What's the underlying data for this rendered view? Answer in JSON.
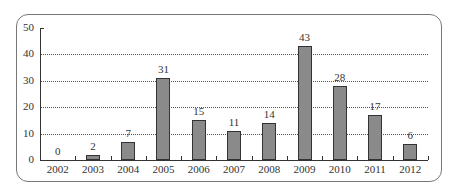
{
  "chart_data": {
    "type": "bar",
    "title": "",
    "xlabel": "",
    "ylabel": "",
    "categories": [
      "2002",
      "2003",
      "2004",
      "2005",
      "2006",
      "2007",
      "2008",
      "2009",
      "2010",
      "2011",
      "2012"
    ],
    "values": [
      0,
      2,
      7,
      31,
      15,
      11,
      14,
      43,
      28,
      17,
      6
    ],
    "ylim": [
      0,
      50
    ],
    "yticks": [
      0,
      10,
      20,
      30,
      40,
      50
    ],
    "grid": true,
    "legend": null,
    "data_labels": true,
    "bar_color": "#8a8a8a"
  }
}
